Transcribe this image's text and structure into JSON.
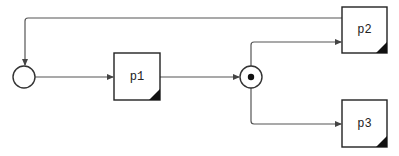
{
  "diagram": {
    "type": "process-flow",
    "nodes": [
      {
        "id": "start",
        "kind": "start-event",
        "label": ""
      },
      {
        "id": "p1",
        "kind": "process",
        "label": "p1"
      },
      {
        "id": "split",
        "kind": "parallel-junction",
        "label": ""
      },
      {
        "id": "p2",
        "kind": "process",
        "label": "p2"
      },
      {
        "id": "p3",
        "kind": "process",
        "label": "p3"
      }
    ],
    "edges": [
      {
        "from": "start",
        "to": "p1"
      },
      {
        "from": "p1",
        "to": "split"
      },
      {
        "from": "split",
        "to": "p2"
      },
      {
        "from": "split",
        "to": "p3"
      },
      {
        "from": "p2",
        "to": "start"
      }
    ],
    "colors": {
      "stroke": "#222222",
      "edge": "#555555",
      "background": "#ffffff"
    }
  }
}
